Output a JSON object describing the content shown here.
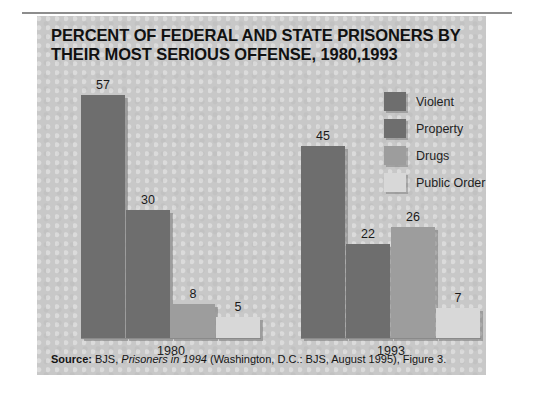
{
  "figure": {
    "title_line1": "PERCENT OF FEDERAL AND STATE PRISONERS BY",
    "title_line2": "THEIR MOST SERIOUS OFFENSE, 1980,1993",
    "source_lead": "Source:",
    "source_text_a": " BJS, ",
    "source_publication": "Prisoners in 1994",
    "source_text_b": " (Washington, D.C.: BJS, August 1995), Figure 3."
  },
  "legend": {
    "position": "top-right",
    "items": [
      {
        "label": "Violent",
        "color": "#6e6e6e"
      },
      {
        "label": "Property",
        "color": "#6e6e6e"
      },
      {
        "label": "Drugs",
        "color": "#9d9d9d"
      },
      {
        "label": "Public Order",
        "color": "#d8d8d8"
      }
    ]
  },
  "groups": [
    {
      "label": "1980",
      "values": [
        {
          "value": "57",
          "h": 243
        },
        {
          "value": "30",
          "h": 128
        },
        {
          "value": "8",
          "h": 34
        },
        {
          "value": "5",
          "h": 21
        }
      ]
    },
    {
      "label": "1993",
      "values": [
        {
          "value": "45",
          "h": 192
        },
        {
          "value": "22",
          "h": 94
        },
        {
          "value": "26",
          "h": 111
        },
        {
          "value": "7",
          "h": 30
        }
      ]
    }
  ],
  "chart_data": {
    "type": "bar",
    "title": "PERCENT OF FEDERAL AND STATE PRISONERS BY THEIR MOST SERIOUS OFFENSE, 1980,1993",
    "xlabel": "",
    "ylabel": "Percent",
    "ylim": [
      0,
      60
    ],
    "grid": false,
    "legend_position": "top-right",
    "categories": [
      "1980",
      "1993"
    ],
    "series": [
      {
        "name": "Violent",
        "values": [
          57,
          30
        ]
      },
      {
        "name": "Property",
        "values": [
          30,
          22
        ]
      },
      {
        "name": "Drugs",
        "values": [
          8,
          26
        ]
      },
      {
        "name": "Public Order",
        "values": [
          5,
          7
        ]
      }
    ],
    "series_by_group": {
      "1980": {
        "Violent": 57,
        "Property": 30,
        "Drugs": 8,
        "Public Order": 5
      },
      "1993": {
        "Violent": 45,
        "Property": 22,
        "Drugs": 26,
        "Public Order": 7
      }
    },
    "data_labels": [
      "57",
      "30",
      "8",
      "5",
      "45",
      "22",
      "26",
      "7"
    ],
    "annotations": [
      "Source: BJS, Prisoners in 1994 (Washington, D.C.: BJS, August 1995), Figure 3."
    ]
  }
}
